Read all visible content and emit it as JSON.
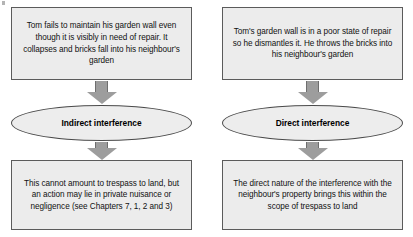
{
  "diagram": {
    "type": "flowchart",
    "columns": [
      {
        "id": "indirect",
        "scenario": "Tom fails to maintain his garden wall even though it is visibly in need of repair. It collapses and bricks fall into his neighbour's garden",
        "classification": "Indirect interference",
        "outcome": "This cannot amount to trespass to land, but an action may lie in private nuisance or negligence (see Chapters 7, 1, 2 and 3)"
      },
      {
        "id": "direct",
        "scenario": "Tom's garden wall is in a poor state of repair so he dismantles it. He throws the bricks into his neighbour's garden",
        "classification": "Direct interference",
        "outcome": "The direct nature of the interference with the neighbour's property brings this within the scope of trespass to land"
      }
    ],
    "connectors": [
      {
        "from": "scenario",
        "to": "classification",
        "icon": "down-arrow-icon"
      },
      {
        "from": "classification",
        "to": "outcome",
        "icon": "down-arrow-icon"
      }
    ],
    "colors": {
      "box_fill": "#ececec",
      "box_border": "#5b5b5b",
      "ellipse_fill": "#ededed",
      "ellipse_border": "#4a4a4a",
      "arrow_fill": "#9d9d9d",
      "text": "#111111",
      "background": "#ffffff"
    }
  }
}
